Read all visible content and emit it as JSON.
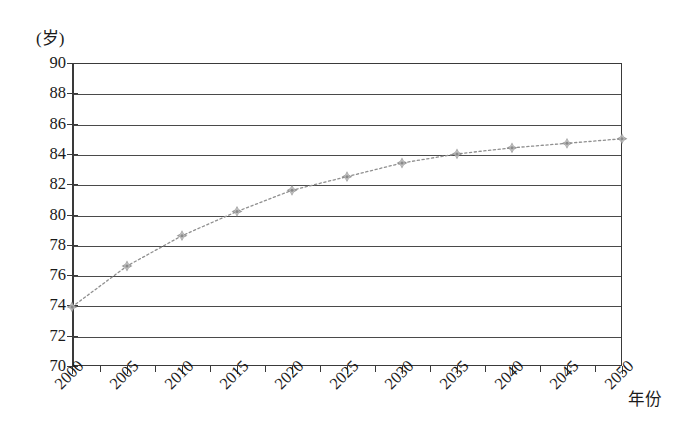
{
  "chart_data": {
    "type": "line",
    "title": "",
    "subtitle": "",
    "xlabel": "年份",
    "ylabel": "(岁)",
    "ylabel_unit": "岁",
    "x": [
      2000,
      2005,
      2010,
      2015,
      2020,
      2025,
      2030,
      2035,
      2040,
      2045,
      2050
    ],
    "categories": [
      "2000",
      "2005",
      "2010",
      "2015",
      "2020",
      "2025",
      "2030",
      "2035",
      "2040",
      "2045",
      "2050"
    ],
    "values": [
      73.9,
      76.6,
      78.6,
      80.2,
      81.6,
      82.5,
      83.4,
      84.0,
      84.4,
      84.7,
      85.0
    ],
    "series": [
      {
        "name": "",
        "values": [
          73.9,
          76.6,
          78.6,
          80.2,
          81.6,
          82.5,
          83.4,
          84.0,
          84.4,
          84.7,
          85.0
        ]
      }
    ],
    "xlim": [
      2000,
      2050
    ],
    "ylim": [
      70,
      90
    ],
    "yticks": [
      90,
      88,
      86,
      84,
      82,
      80,
      78,
      76,
      74,
      72,
      70
    ],
    "ytick_labels": [
      "90",
      "88",
      "86",
      "84",
      "82",
      "80",
      "78",
      "76",
      "74",
      "72",
      "70"
    ],
    "xticks": [
      2000,
      2005,
      2010,
      2015,
      2020,
      2025,
      2030,
      2035,
      2040,
      2045,
      2050
    ],
    "xtick_labels": [
      "2000",
      "2005",
      "2010",
      "2015",
      "2020",
      "2025",
      "2030",
      "2035",
      "2040",
      "2045",
      "2050"
    ],
    "x_minor_tick_step": 2.5,
    "grid": {
      "horizontal": true,
      "vertical": false,
      "color": "#4a4a4a"
    },
    "legend": {
      "visible": false,
      "position": "none",
      "entries": []
    },
    "line_style": "dotted",
    "line_color": "#8f8f8f",
    "marker": "diamond-star",
    "marker_color": "#8a8a8a",
    "colors": {
      "background": "#ffffff",
      "axis": "#3a3a3a",
      "grid": "#4a4a4a",
      "series": "#8a8a8a",
      "text": "#1a1a1a"
    }
  }
}
